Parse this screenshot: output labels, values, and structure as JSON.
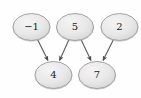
{
  "graph": {
    "type": "directed-acyclic-graph",
    "background_color": "#fefefe",
    "node_fill_color": "#e6e6e6",
    "node_stroke_color": "#9a9a9a",
    "edge_color": "#5c5c5c",
    "label_color": "#1c1c1c",
    "nodes": [
      {
        "id": "n-minus1",
        "label": "−1",
        "cx": 31.5,
        "cy": 27.0,
        "rx": 18.5,
        "ry": 13.5,
        "row": "top"
      },
      {
        "id": "n-5",
        "label": "5",
        "cx": 75.0,
        "cy": 27.0,
        "rx": 18.5,
        "ry": 13.5,
        "row": "top"
      },
      {
        "id": "n-2",
        "label": "2",
        "cx": 119.5,
        "cy": 27.0,
        "rx": 18.5,
        "ry": 13.5,
        "row": "top"
      },
      {
        "id": "n-4",
        "label": "4",
        "cx": 53.5,
        "cy": 75.0,
        "rx": 18.5,
        "ry": 13.5,
        "row": "bottom"
      },
      {
        "id": "n-7",
        "label": "7",
        "cx": 97.0,
        "cy": 75.0,
        "rx": 18.5,
        "ry": 13.5,
        "row": "bottom"
      }
    ],
    "edges": [
      {
        "id": "e-minus1-4",
        "from": "n-minus1",
        "from_label": "−1",
        "to": "n-4",
        "to_label": "4",
        "x1": 37.5,
        "y1": 39.5,
        "x2": 48.0,
        "y2": 60.5,
        "directed": true
      },
      {
        "id": "e-5-4",
        "from": "n-5",
        "from_label": "5",
        "to": "n-4",
        "to_label": "4",
        "x1": 69.0,
        "y1": 39.5,
        "x2": 59.5,
        "y2": 60.5,
        "directed": true
      },
      {
        "id": "e-5-7",
        "from": "n-5",
        "from_label": "5",
        "to": "n-7",
        "to_label": "7",
        "x1": 81.0,
        "y1": 39.5,
        "x2": 91.0,
        "y2": 60.5,
        "directed": true
      },
      {
        "id": "e-2-7",
        "from": "n-2",
        "from_label": "2",
        "to": "n-7",
        "to_label": "7",
        "x1": 113.5,
        "y1": 39.5,
        "x2": 103.0,
        "y2": 60.5,
        "directed": true
      }
    ]
  }
}
